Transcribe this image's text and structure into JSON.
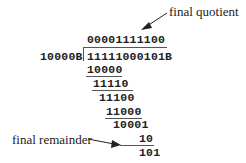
{
  "diagram": {
    "type": "binary long division",
    "divisor": "10000B",
    "dividend": "11111000101B",
    "quotient": "00001111100",
    "steps": [
      {
        "text": "10000",
        "underlined": true
      },
      {
        "text": "11110",
        "underlined": true
      },
      {
        "text": "11100",
        "underlined": false
      },
      {
        "text": "11000",
        "underlined": true
      },
      {
        "text": "10001",
        "underlined": false
      },
      {
        "text": "10",
        "underlined": true
      },
      {
        "text": "101",
        "underlined": false
      }
    ],
    "annotations": {
      "quotient_label": "final quotient",
      "remainder_label": "final remainder"
    }
  }
}
